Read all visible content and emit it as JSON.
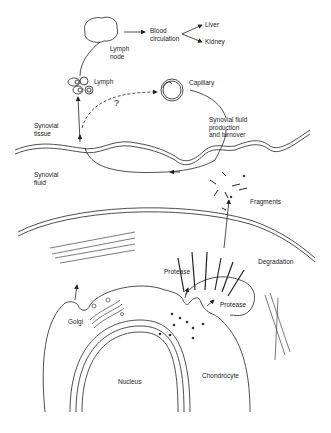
{
  "diagram": {
    "labels": {
      "lymph_node": "Lymph\nnode",
      "blood_circulation": "Blood\ncirculation",
      "liver": "Liver",
      "kidney": "Kidney",
      "lymph": "Lymph",
      "question": "?",
      "capillary": "Capillary",
      "synovial_tissue": "Synovial\ntissue",
      "synovial_fluid_production": "Synovial fluid\nproduction\nand turnover",
      "synovial_fluid": "Synovial\nfluid",
      "fragments": "Fragments",
      "degradation": "Degradation",
      "protease_1": "Protease",
      "protease_2": "Protease",
      "golgi": "Golgi",
      "chondrocyte": "Chondrocyte",
      "nucleus": "Nucleus"
    },
    "colors": {
      "line": "#222222",
      "background": "#ffffff"
    }
  }
}
